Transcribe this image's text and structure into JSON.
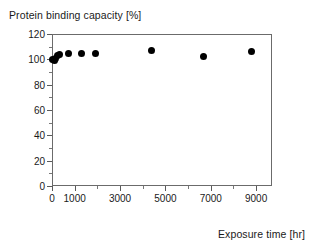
{
  "chart_data": {
    "type": "scatter",
    "title": "",
    "xlabel": "Exposure time [hr]",
    "ylabel": "Protein binding capacity [%]",
    "xlim": [
      0,
      9700
    ],
    "ylim": [
      0,
      120
    ],
    "grid": false,
    "legend": null,
    "marker": {
      "shape": "circle",
      "color": "#000000",
      "size": 7
    },
    "x_ticks": [
      0,
      1000,
      3000,
      5000,
      7000,
      9000
    ],
    "x_tick_labels": [
      "0",
      "1000",
      "3000",
      "5000",
      "7000",
      "9000"
    ],
    "x_minor_ticks": [
      2000,
      4000,
      6000,
      8000
    ],
    "y_ticks": [
      0,
      20,
      40,
      60,
      80,
      100,
      120
    ],
    "y_tick_labels": [
      "0",
      "20",
      "40",
      "60",
      "80",
      "100",
      "120"
    ],
    "y_minor_ticks": [
      10,
      30,
      50,
      70,
      90,
      110
    ],
    "x": [
      24,
      100,
      170,
      240,
      340,
      720,
      1300,
      1900,
      4400,
      6700,
      8800
    ],
    "y": [
      100,
      99,
      101,
      103,
      104,
      105,
      105,
      105,
      107,
      102,
      106
    ],
    "points": [
      {
        "x": 24,
        "y": 100
      },
      {
        "x": 100,
        "y": 99
      },
      {
        "x": 170,
        "y": 101
      },
      {
        "x": 240,
        "y": 103
      },
      {
        "x": 340,
        "y": 104
      },
      {
        "x": 720,
        "y": 105
      },
      {
        "x": 1300,
        "y": 105
      },
      {
        "x": 1900,
        "y": 105
      },
      {
        "x": 4400,
        "y": 107
      },
      {
        "x": 6700,
        "y": 102
      },
      {
        "x": 8800,
        "y": 106
      }
    ]
  },
  "colors": {
    "marker": "#000000",
    "axis": "#6b6b6b",
    "text": "#1a1a1a",
    "background": "#ffffff"
  }
}
